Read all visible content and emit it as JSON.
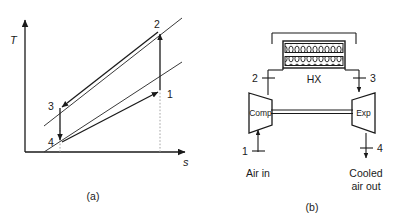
{
  "figure": {
    "type": "thermodynamics-diagram",
    "panels": [
      {
        "id": "a",
        "caption": "(a)",
        "kind": "T-s diagram",
        "axes": {
          "y_label": "T",
          "x_label": "s"
        },
        "state_points": [
          "1",
          "2",
          "3",
          "4"
        ],
        "process_labels": {
          "p1": "1",
          "p2": "2",
          "p3": "3",
          "p4": "4"
        }
      },
      {
        "id": "b",
        "caption": "(b)",
        "kind": "schematic",
        "components": {
          "compressor": "Comp",
          "expander": "Exp",
          "heat_exchanger": "HX"
        },
        "stream_labels": {
          "inlet": "1",
          "after_compressor": "2",
          "after_hx": "3",
          "outlet": "4"
        },
        "annotations": {
          "inlet_text": "Air in",
          "outlet_text_line1": "Cooled",
          "outlet_text_line2": "air out"
        }
      }
    ]
  },
  "colors": {
    "line": "#1a1a1a",
    "dotted": "#8a8a8a",
    "background": "#ffffff"
  }
}
